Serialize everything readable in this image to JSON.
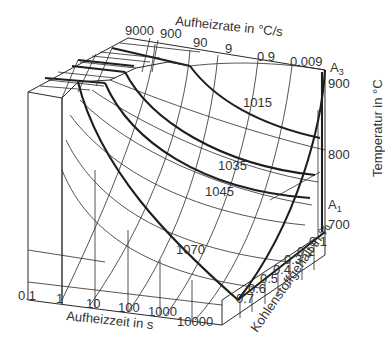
{
  "diagram": {
    "type": "3d-surface",
    "axes": {
      "top": {
        "title": "Aufheizrate in °C/s",
        "ticks": [
          "9000",
          "900",
          "90",
          "9",
          "0.9",
          "0.009"
        ]
      },
      "bottom": {
        "title": "Aufheizzeit in s",
        "ticks": [
          "0.1",
          "1",
          "10",
          "100",
          "1000",
          "10000"
        ]
      },
      "depth": {
        "title": "Kohlenstoffgehalt in %",
        "ticks": [
          "0.1",
          "0.2",
          "0.3",
          "0.4",
          "0.5",
          "0.6",
          "0.7"
        ]
      },
      "vertical": {
        "title": "Temperatur in °C",
        "ticks": [
          "900",
          "800",
          "700"
        ]
      }
    },
    "markers": {
      "a3": {
        "letter": "A",
        "sub": "3"
      },
      "a1": {
        "letter": "A",
        "sub": "1"
      }
    },
    "isolines": [
      "1015",
      "1035",
      "1045",
      "1070"
    ]
  }
}
